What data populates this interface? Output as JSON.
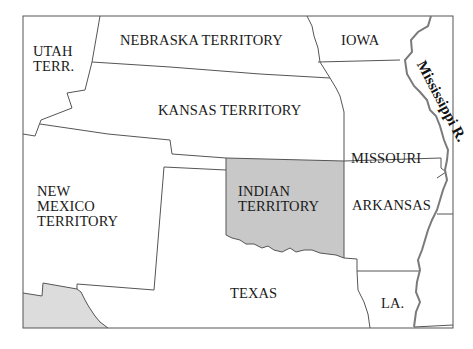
{
  "map": {
    "colors": {
      "background": "#ffffff",
      "border": "#555555",
      "river": "#7a7a7a",
      "indian_territory_fill": "#c8c8c8",
      "mexico_fill": "#dcdcdc"
    },
    "regions": [
      {
        "id": "utah",
        "label_lines": [
          "UTAH",
          "TERR."
        ]
      },
      {
        "id": "nebraska",
        "label_lines": [
          "NEBRASKA TERRITORY"
        ]
      },
      {
        "id": "iowa",
        "label_lines": [
          "IOWA"
        ]
      },
      {
        "id": "kansas",
        "label_lines": [
          "KANSAS TERRITORY"
        ]
      },
      {
        "id": "missouri",
        "label_lines": [
          "MISSOURI"
        ]
      },
      {
        "id": "new_mexico",
        "label_lines": [
          "NEW",
          "MEXICO",
          "TERRITORY"
        ]
      },
      {
        "id": "indian_territory",
        "label_lines": [
          "INDIAN",
          "TERRITORY"
        ],
        "highlighted": true
      },
      {
        "id": "arkansas",
        "label_lines": [
          "ARKANSAS"
        ]
      },
      {
        "id": "texas",
        "label_lines": [
          "TEXAS"
        ]
      },
      {
        "id": "louisiana",
        "label_lines": [
          "LA."
        ]
      }
    ],
    "river_label": "Mississippi R."
  }
}
